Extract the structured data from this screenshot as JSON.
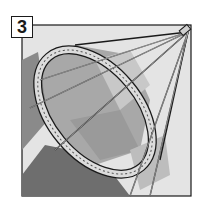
{
  "illustration": {
    "step_number": "3",
    "subject": "hoop-frame-with-radiating-struts",
    "colors": {
      "background": "#ffffff",
      "panel_light": "#e4e4e4",
      "panel_mid": "#a8a8a8",
      "panel_dark": "#7a7a7a",
      "panel_darker": "#6a6a6a",
      "hoop_fill": "#d9d9d9",
      "outline": "#1a1a1a"
    }
  }
}
